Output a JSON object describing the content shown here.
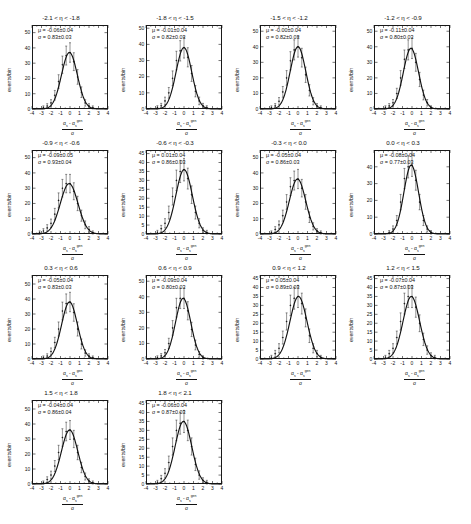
{
  "figure": {
    "axis": {
      "ylabel": "events/bin",
      "xlabel_numerator_a": "α",
      "xlabel_numerator_sub": "s",
      "xlabel_numerator_minus": " - α",
      "xlabel_numerator_sup": "gen",
      "xlabel_denominator": "σ",
      "x_ticks": [
        "-4",
        "-3",
        "-2",
        "-1",
        "0",
        "1",
        "2",
        "3",
        "4"
      ],
      "x_tick_values": [
        -4,
        -3,
        -2,
        -1,
        0,
        1,
        2,
        3,
        4
      ],
      "xlim": [
        -4,
        4
      ],
      "mu_prefix": "μ = ",
      "sigma_prefix": "σ = ",
      "grid": false,
      "legend_position": "in-panel-top-left"
    },
    "style": {
      "line_color": "#111111",
      "marker_color": "#111111",
      "frame_color": "#1a1a1a",
      "background": "#ffffff"
    }
  },
  "chart_data": [
    {
      "type": "line",
      "title": "-2.1 < η < -1.8",
      "xlabel": "(αs - αs^gen)/σ",
      "ylabel": "events/bin",
      "mu": "-0.06±0.04",
      "sigma": "0.83±0.03",
      "mu_value": -0.06,
      "sigma_value": 0.83,
      "amplitude": 37,
      "ylim": [
        0,
        55
      ],
      "y_ticks": [
        0,
        10,
        20,
        30,
        40,
        50
      ],
      "x": [
        -3.6,
        -3.2,
        -2.8,
        -2.4,
        -2.0,
        -1.6,
        -1.2,
        -0.8,
        -0.4,
        0.0,
        0.4,
        0.8,
        1.2,
        1.6,
        2.0,
        2.4,
        2.8,
        3.2
      ],
      "values": [
        0,
        0,
        1,
        2,
        4,
        9,
        18,
        29,
        35,
        37,
        31,
        21,
        11,
        4,
        2,
        1,
        0,
        0
      ]
    },
    {
      "type": "line",
      "title": "-1.8 < η < -1.5",
      "xlabel": "(αs - αs^gen)/σ",
      "ylabel": "events/bin",
      "mu": "-0.01±0.04",
      "sigma": "0.82±0.03",
      "mu_value": -0.01,
      "sigma_value": 0.82,
      "amplitude": 38,
      "ylim": [
        0,
        52
      ],
      "y_ticks": [
        0,
        10,
        20,
        30,
        40,
        50
      ],
      "x": [
        -3.6,
        -3.2,
        -2.8,
        -2.4,
        -2.0,
        -1.6,
        -1.2,
        -0.8,
        -0.4,
        0.0,
        0.4,
        0.8,
        1.2,
        1.6,
        2.0,
        2.4,
        2.8,
        3.2
      ],
      "values": [
        0,
        0,
        1,
        2,
        5,
        10,
        19,
        30,
        36,
        38,
        32,
        22,
        11,
        5,
        2,
        1,
        0,
        0
      ]
    },
    {
      "type": "line",
      "title": "-1.5 < η < -1.2",
      "xlabel": "(αs - αs^gen)/σ",
      "ylabel": "events/bin",
      "mu": "-0.00±0.04",
      "sigma": "0.82±0.03",
      "mu_value": 0.0,
      "sigma_value": 0.82,
      "amplitude": 40,
      "ylim": [
        0,
        54
      ],
      "y_ticks": [
        0,
        10,
        20,
        30,
        40,
        50
      ],
      "x": [
        -3.6,
        -3.2,
        -2.8,
        -2.4,
        -2.0,
        -1.6,
        -1.2,
        -0.8,
        -0.4,
        0.0,
        0.4,
        0.8,
        1.2,
        1.6,
        2.0,
        2.4,
        2.8,
        3.2
      ],
      "values": [
        0,
        0,
        1,
        2,
        5,
        11,
        20,
        31,
        38,
        40,
        33,
        22,
        12,
        5,
        2,
        1,
        0,
        0
      ]
    },
    {
      "type": "line",
      "title": "-1.2 < η < -0.9",
      "xlabel": "(αs - αs^gen)/σ",
      "ylabel": "events/bin",
      "mu": "-0.11±0.04",
      "sigma": "0.80±0.03",
      "mu_value": -0.11,
      "sigma_value": 0.8,
      "amplitude": 39,
      "ylim": [
        0,
        54
      ],
      "y_ticks": [
        0,
        10,
        20,
        30,
        40,
        50
      ],
      "x": [
        -3.6,
        -3.2,
        -2.8,
        -2.4,
        -2.0,
        -1.6,
        -1.2,
        -0.8,
        -0.4,
        0.0,
        0.4,
        0.8,
        1.2,
        1.6,
        2.0,
        2.4,
        2.8,
        3.2
      ],
      "values": [
        0,
        0,
        1,
        2,
        4,
        10,
        20,
        32,
        38,
        39,
        30,
        19,
        9,
        4,
        1,
        0,
        0,
        0
      ]
    },
    {
      "type": "line",
      "title": "-0.9 < η < -0.6",
      "xlabel": "(αs - αs^gen)/σ",
      "ylabel": "events/bin",
      "mu": "-0.09±0.05",
      "sigma": "0.93±0.04",
      "mu_value": -0.09,
      "sigma_value": 0.93,
      "amplitude": 33,
      "ylim": [
        0,
        55
      ],
      "y_ticks": [
        0,
        10,
        20,
        30,
        40,
        50
      ],
      "x": [
        -3.6,
        -3.2,
        -2.8,
        -2.4,
        -2.0,
        -1.6,
        -1.2,
        -0.8,
        -0.4,
        0.0,
        0.4,
        0.8,
        1.2,
        1.6,
        2.0,
        2.4,
        2.8,
        3.2
      ],
      "values": [
        0,
        1,
        2,
        4,
        7,
        13,
        22,
        30,
        33,
        33,
        28,
        20,
        12,
        6,
        3,
        1,
        0,
        0
      ]
    },
    {
      "type": "line",
      "title": "-0.6 < η < -0.3",
      "xlabel": "(αs - αs^gen)/σ",
      "ylabel": "events/bin",
      "mu": "0.01±0.04",
      "sigma": "0.86±0.03",
      "mu_value": 0.01,
      "sigma_value": 0.86,
      "amplitude": 36,
      "ylim": [
        0,
        47
      ],
      "y_ticks": [
        0,
        5,
        10,
        15,
        20,
        25,
        30,
        35,
        40,
        45
      ],
      "x": [
        -3.6,
        -3.2,
        -2.8,
        -2.4,
        -2.0,
        -1.6,
        -1.2,
        -0.8,
        -0.4,
        0.0,
        0.4,
        0.8,
        1.2,
        1.6,
        2.0,
        2.4,
        2.8,
        3.2
      ],
      "values": [
        0,
        0,
        1,
        3,
        6,
        12,
        21,
        30,
        35,
        36,
        31,
        22,
        12,
        6,
        2,
        1,
        0,
        0
      ]
    },
    {
      "type": "line",
      "title": "-0.3 < η < 0.0",
      "xlabel": "(αs - αs^gen)/σ",
      "ylabel": "events/bin",
      "mu": "-0.05±0.04",
      "sigma": "0.86±0.03",
      "mu_value": -0.05,
      "sigma_value": 0.86,
      "amplitude": 36,
      "ylim": [
        0,
        55
      ],
      "y_ticks": [
        0,
        10,
        20,
        30,
        40,
        50
      ],
      "x": [
        -3.6,
        -3.2,
        -2.8,
        -2.4,
        -2.0,
        -1.6,
        -1.2,
        -0.8,
        -0.4,
        0.0,
        0.4,
        0.8,
        1.2,
        1.6,
        2.0,
        2.4,
        2.8,
        3.2
      ],
      "values": [
        0,
        0,
        1,
        3,
        6,
        12,
        21,
        31,
        35,
        36,
        30,
        21,
        11,
        5,
        2,
        1,
        0,
        0
      ]
    },
    {
      "type": "line",
      "title": "0.0 < η < 0.3",
      "xlabel": "(αs - αs^gen)/σ",
      "ylabel": "events/bin",
      "mu": "-0.08±0.04",
      "sigma": "0.77±0.03",
      "mu_value": -0.08,
      "sigma_value": 0.77,
      "amplitude": 41,
      "ylim": [
        0,
        50
      ],
      "y_ticks": [
        0,
        10,
        20,
        30,
        40
      ],
      "x": [
        -3.6,
        -3.2,
        -2.8,
        -2.4,
        -2.0,
        -1.6,
        -1.2,
        -0.8,
        -0.4,
        0.0,
        0.4,
        0.8,
        1.2,
        1.6,
        2.0,
        2.4,
        2.8,
        3.2
      ],
      "values": [
        0,
        0,
        0,
        1,
        3,
        8,
        19,
        33,
        40,
        41,
        32,
        19,
        8,
        3,
        1,
        0,
        0,
        0
      ]
    },
    {
      "type": "line",
      "title": "0.3 < η < 0.6",
      "xlabel": "(αs - αs^gen)/σ",
      "ylabel": "events/bin",
      "mu": "-0.05±0.04",
      "sigma": "0.83±0.03",
      "mu_value": -0.05,
      "sigma_value": 0.83,
      "amplitude": 38,
      "ylim": [
        0,
        56
      ],
      "y_ticks": [
        0,
        10,
        20,
        30,
        40,
        50
      ],
      "x": [
        -3.6,
        -3.2,
        -2.8,
        -2.4,
        -2.0,
        -1.6,
        -1.2,
        -0.8,
        -0.4,
        0.0,
        0.4,
        0.8,
        1.2,
        1.6,
        2.0,
        2.4,
        2.8,
        3.2
      ],
      "values": [
        0,
        0,
        1,
        2,
        5,
        11,
        20,
        32,
        37,
        38,
        31,
        20,
        10,
        4,
        2,
        1,
        0,
        0
      ]
    },
    {
      "type": "line",
      "title": "0.6 < η < 0.9",
      "xlabel": "(αs - αs^gen)/σ",
      "ylabel": "events/bin",
      "mu": "-0.09±0.04",
      "sigma": "0.80±0.03",
      "mu_value": -0.09,
      "sigma_value": 0.8,
      "amplitude": 39,
      "ylim": [
        0,
        54
      ],
      "y_ticks": [
        0,
        10,
        20,
        30,
        40,
        50
      ],
      "x": [
        -3.6,
        -3.2,
        -2.8,
        -2.4,
        -2.0,
        -1.6,
        -1.2,
        -0.8,
        -0.4,
        0.0,
        0.4,
        0.8,
        1.2,
        1.6,
        2.0,
        2.4,
        2.8,
        3.2
      ],
      "values": [
        0,
        0,
        1,
        2,
        4,
        10,
        20,
        33,
        39,
        39,
        31,
        19,
        9,
        3,
        1,
        0,
        0,
        0
      ]
    },
    {
      "type": "line",
      "title": "0.9 < η < 1.2",
      "xlabel": "(αs - αs^gen)/σ",
      "ylabel": "events/bin",
      "mu": "0.05±0.04",
      "sigma": "0.89±0.03",
      "mu_value": 0.05,
      "sigma_value": 0.89,
      "amplitude": 35,
      "ylim": [
        0,
        47
      ],
      "y_ticks": [
        0,
        5,
        10,
        15,
        20,
        25,
        30,
        35,
        40,
        45
      ],
      "x": [
        -3.6,
        -3.2,
        -2.8,
        -2.4,
        -2.0,
        -1.6,
        -1.2,
        -0.8,
        -0.4,
        0.0,
        0.4,
        0.8,
        1.2,
        1.6,
        2.0,
        2.4,
        2.8,
        3.2
      ],
      "values": [
        0,
        0,
        1,
        3,
        6,
        12,
        21,
        30,
        34,
        35,
        31,
        23,
        13,
        6,
        3,
        1,
        0,
        0
      ]
    },
    {
      "type": "line",
      "title": "1.2 < η < 1.5",
      "xlabel": "(αs - αs^gen)/σ",
      "ylabel": "events/bin",
      "mu": "-0.07±0.04",
      "sigma": "0.87±0.03",
      "mu_value": -0.07,
      "sigma_value": 0.87,
      "amplitude": 35,
      "ylim": [
        0,
        47
      ],
      "y_ticks": [
        0,
        5,
        10,
        15,
        20,
        25,
        30,
        35,
        40,
        45
      ],
      "x": [
        -3.6,
        -3.2,
        -2.8,
        -2.4,
        -2.0,
        -1.6,
        -1.2,
        -0.8,
        -0.4,
        0.0,
        0.4,
        0.8,
        1.2,
        1.6,
        2.0,
        2.4,
        2.8,
        3.2
      ],
      "values": [
        0,
        0,
        1,
        3,
        6,
        12,
        21,
        31,
        35,
        35,
        29,
        20,
        11,
        5,
        2,
        1,
        0,
        0
      ]
    },
    {
      "type": "line",
      "title": "1.5 < η < 1.8",
      "xlabel": "(αs - αs^gen)/σ",
      "ylabel": "events/bin",
      "mu": "-0.04±0.04",
      "sigma": "0.86±0.04",
      "mu_value": -0.04,
      "sigma_value": 0.86,
      "amplitude": 36,
      "ylim": [
        0,
        56
      ],
      "y_ticks": [
        0,
        10,
        20,
        30,
        40,
        50
      ],
      "x": [
        -3.6,
        -3.2,
        -2.8,
        -2.4,
        -2.0,
        -1.6,
        -1.2,
        -0.8,
        -0.4,
        0.0,
        0.4,
        0.8,
        1.2,
        1.6,
        2.0,
        2.4,
        2.8,
        3.2
      ],
      "values": [
        0,
        0,
        1,
        3,
        6,
        12,
        21,
        31,
        35,
        36,
        30,
        21,
        11,
        5,
        2,
        1,
        0,
        0
      ]
    },
    {
      "type": "line",
      "title": "1.8 < η < 2.1",
      "xlabel": "(αs - αs^gen)/σ",
      "ylabel": "events/bin",
      "mu": "-0.06±0.04",
      "sigma": "0.87±0.03",
      "mu_value": -0.06,
      "sigma_value": 0.87,
      "amplitude": 35,
      "ylim": [
        0,
        47
      ],
      "y_ticks": [
        0,
        5,
        10,
        15,
        20,
        25,
        30,
        35,
        40,
        45
      ],
      "x": [
        -3.6,
        -3.2,
        -2.8,
        -2.4,
        -2.0,
        -1.6,
        -1.2,
        -0.8,
        -0.4,
        0.0,
        0.4,
        0.8,
        1.2,
        1.6,
        2.0,
        2.4,
        2.8,
        3.2
      ],
      "values": [
        0,
        0,
        1,
        3,
        6,
        12,
        21,
        30,
        34,
        35,
        30,
        21,
        11,
        5,
        2,
        1,
        0,
        0
      ]
    }
  ]
}
